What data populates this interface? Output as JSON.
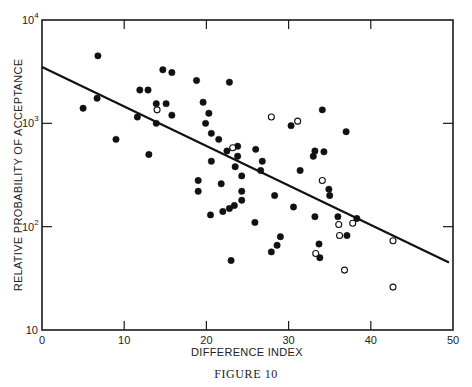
{
  "figure": {
    "caption": "Figure 10",
    "caption_display": "FIGURE 10"
  },
  "chart_data": {
    "type": "scatter",
    "title": "",
    "xlabel": "DIFFERENCE INDEX",
    "ylabel": "RELATIVE PROBABILITY OF ACCEPTANCE",
    "xlim": [
      0,
      50
    ],
    "ylim": [
      10,
      10000
    ],
    "yscale": "log",
    "grid": false,
    "legend": null,
    "x_ticks": [
      0,
      10,
      20,
      30,
      40,
      50
    ],
    "x_tick_labels": [
      "0",
      "10",
      "20",
      "30",
      "40",
      "50"
    ],
    "y_ticks": [
      10,
      100,
      1000,
      10000
    ],
    "y_tick_labels": [
      {
        "base": "10",
        "exp": ""
      },
      {
        "base": "10",
        "exp": "2"
      },
      {
        "base": "10",
        "exp": "3"
      },
      {
        "base": "10",
        "exp": "4"
      }
    ],
    "fit_line": {
      "x": [
        0,
        50
      ],
      "y": [
        3500,
        45
      ]
    },
    "series": [
      {
        "name": "filled",
        "marker": "filled-circle",
        "points": [
          [
            5,
            1400
          ],
          [
            6.7,
            1750
          ],
          [
            6.8,
            4500
          ],
          [
            9,
            700
          ],
          [
            11.6,
            1150
          ],
          [
            11.9,
            2100
          ],
          [
            12.9,
            2100
          ],
          [
            13,
            500
          ],
          [
            13.9,
            1550
          ],
          [
            13.9,
            1000
          ],
          [
            14.7,
            3300
          ],
          [
            15.1,
            1550
          ],
          [
            15.8,
            3100
          ],
          [
            15.8,
            1200
          ],
          [
            18.8,
            2600
          ],
          [
            19,
            280
          ],
          [
            19,
            220
          ],
          [
            19.6,
            1600
          ],
          [
            19.9,
            1000
          ],
          [
            20.3,
            1250
          ],
          [
            20.5,
            130
          ],
          [
            20.6,
            800
          ],
          [
            20.6,
            430
          ],
          [
            21.5,
            700
          ],
          [
            21.8,
            260
          ],
          [
            22,
            140
          ],
          [
            22.5,
            540
          ],
          [
            22.8,
            150
          ],
          [
            22.8,
            2500
          ],
          [
            23,
            47
          ],
          [
            23.4,
            160
          ],
          [
            23.5,
            380
          ],
          [
            23.8,
            480
          ],
          [
            23.8,
            600
          ],
          [
            24.3,
            310
          ],
          [
            24.3,
            220
          ],
          [
            24.3,
            180
          ],
          [
            25.9,
            110
          ],
          [
            26,
            560
          ],
          [
            26.6,
            350
          ],
          [
            26.8,
            430
          ],
          [
            27.9,
            57
          ],
          [
            28.3,
            200
          ],
          [
            28.6,
            66
          ],
          [
            29,
            80
          ],
          [
            30.3,
            950
          ],
          [
            30.6,
            155
          ],
          [
            31.4,
            350
          ],
          [
            33,
            480
          ],
          [
            33.2,
            540
          ],
          [
            33.2,
            125
          ],
          [
            33.7,
            68
          ],
          [
            33.8,
            50
          ],
          [
            34.1,
            1350
          ],
          [
            34.3,
            530
          ],
          [
            34.9,
            230
          ],
          [
            35.0,
            200
          ],
          [
            36.0,
            125
          ],
          [
            37.0,
            830
          ],
          [
            37.1,
            82
          ],
          [
            38.3,
            120
          ]
        ]
      },
      {
        "name": "open",
        "marker": "open-circle",
        "points": [
          [
            14,
            1350
          ],
          [
            23.2,
            580
          ],
          [
            27.9,
            1150
          ],
          [
            31.1,
            1050
          ],
          [
            34.1,
            280
          ],
          [
            36.1,
            105
          ],
          [
            36.2,
            82
          ],
          [
            36.8,
            38
          ],
          [
            37.8,
            108
          ],
          [
            33.3,
            55
          ],
          [
            42.7,
            73
          ],
          [
            42.7,
            26
          ]
        ]
      }
    ]
  }
}
